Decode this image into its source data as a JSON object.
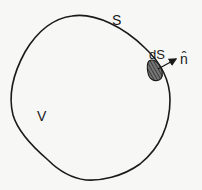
{
  "diagram": {
    "type": "closed surface with surface element and outward normal",
    "labels": {
      "surface": "S",
      "surface_element": "dS",
      "normal": "n̂",
      "volume": "V"
    },
    "colors": {
      "stroke": "#1a1a1a",
      "background": "#f7f7f5",
      "patch_fill": "#555555"
    }
  }
}
